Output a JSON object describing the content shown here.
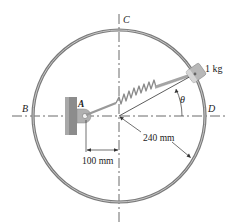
{
  "diagram": {
    "points": {
      "A": "A",
      "B": "B",
      "C": "C",
      "D": "D"
    },
    "mass_label": "1 kg",
    "angle_label": "θ",
    "radius_label": "240 mm",
    "offset_label": "100 mm",
    "colors": {
      "ring": "#7a7a7a",
      "ring_inner": "#bdbdbd",
      "collar": "#b8b8b8",
      "support": "#8c8c8c",
      "spring": "#8a8a8a",
      "lines": "#333333"
    }
  }
}
